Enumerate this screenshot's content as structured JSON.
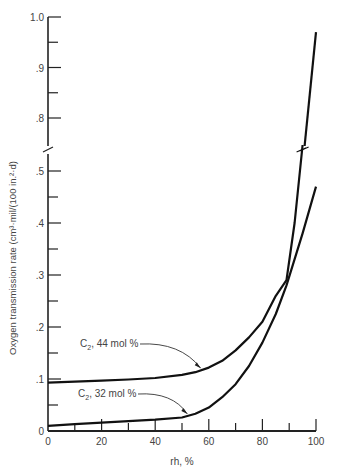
{
  "chart_data": {
    "type": "line",
    "title": "",
    "xlabel": "rh, %",
    "ylabel": "Oxygen transmission rate (cm³·mil/(100 in.²·d)",
    "xlim": [
      0,
      100
    ],
    "ylim": [
      0,
      1.0
    ],
    "y_axis_break": [
      0.55,
      0.75
    ],
    "grid": false,
    "legend": "inline annotations with arrows",
    "x_ticks": [
      0,
      20,
      40,
      60,
      80,
      100
    ],
    "x_tick_labels": [
      "0",
      "20",
      "40",
      "60",
      "80",
      "100"
    ],
    "y_ticks": [
      0,
      0.1,
      0.2,
      0.3,
      0.4,
      0.5,
      0.8,
      0.9,
      1.0
    ],
    "y_tick_labels": [
      "0",
      ".1",
      ".2",
      ".3",
      ".4",
      ".5",
      ".8",
      ".9",
      "1.0"
    ],
    "series": [
      {
        "name": "C₂, 44 mol %",
        "x": [
          0,
          10,
          20,
          30,
          40,
          50,
          55,
          60,
          65,
          70,
          75,
          80,
          85,
          89,
          92,
          95,
          100
        ],
        "values": [
          0.093,
          0.095,
          0.097,
          0.099,
          0.102,
          0.108,
          0.113,
          0.122,
          0.135,
          0.155,
          0.18,
          0.21,
          0.26,
          0.29,
          0.4,
          0.55,
          0.97
        ]
      },
      {
        "name": "C₂, 32 mol %",
        "x": [
          0,
          10,
          20,
          30,
          40,
          50,
          55,
          60,
          65,
          70,
          75,
          80,
          85,
          89,
          95,
          100
        ],
        "values": [
          0.01,
          0.013,
          0.016,
          0.019,
          0.022,
          0.026,
          0.033,
          0.045,
          0.065,
          0.09,
          0.125,
          0.17,
          0.225,
          0.28,
          0.38,
          0.47
        ]
      }
    ],
    "annotations": [
      {
        "text_main": "C",
        "text_sub": "2",
        "text_rest": ", 44 mol %",
        "target_x": 57,
        "target_y": 0.115
      },
      {
        "text_main": "C",
        "text_sub": "2",
        "text_rest": ", 32 mol %",
        "target_x": 52,
        "target_y": 0.027
      }
    ]
  }
}
